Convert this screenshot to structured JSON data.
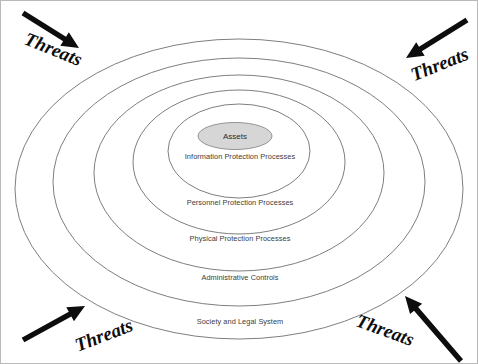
{
  "diagram": {
    "type": "concentric-security-onion",
    "background_color": "#ffffff",
    "border_color": "#b9b9b9",
    "ring_stroke_color": "#6f6f6f",
    "label_color": "#3b3b3b",
    "arrow_color": "#0d0d0d",
    "core": {
      "label": "Assets",
      "fill_color": "#d6d6d6",
      "stroke_color": "#8a8a8a",
      "cx": 234,
      "cy": 135,
      "rx": 37,
      "ry": 13.5
    },
    "rings": [
      {
        "index": 1,
        "label": "Information Protection Processes",
        "cx": 238,
        "cy": 150,
        "rx": 71,
        "ry": 47,
        "label_x": 239,
        "label_y": 158
      },
      {
        "index": 2,
        "label": "Personnel Protection Processes",
        "cx": 238,
        "cy": 161,
        "rx": 106,
        "ry": 72,
        "label_x": 239,
        "label_y": 204
      },
      {
        "index": 3,
        "label": "Physical Protection Processes",
        "cx": 238,
        "cy": 172,
        "rx": 145,
        "ry": 98,
        "label_x": 239,
        "label_y": 240
      },
      {
        "index": 4,
        "label": "Administrative Controls",
        "cx": 238,
        "cy": 181,
        "rx": 186,
        "ry": 124,
        "label_x": 239,
        "label_y": 279
      },
      {
        "index": 5,
        "label": "Society and Legal System",
        "cx": 238,
        "cy": 188,
        "rx": 224,
        "ry": 150,
        "label_x": 239,
        "label_y": 323
      }
    ],
    "threats": [
      {
        "position": "top-left",
        "label": "Threats",
        "label_x": 50,
        "label_y": 54,
        "label_rotation": 22,
        "arrow_tail_x": 22,
        "arrow_tail_y": 12,
        "arrow_tip_x": 78,
        "arrow_tip_y": 47
      },
      {
        "position": "top-right",
        "label": "Threats",
        "label_x": 441,
        "label_y": 69,
        "label_rotation": -22,
        "arrow_tail_x": 466,
        "arrow_tail_y": 19,
        "arrow_tip_x": 405,
        "arrow_tip_y": 57
      },
      {
        "position": "bottom-left",
        "label": "Threats",
        "label_x": 105,
        "label_y": 340,
        "label_rotation": -21,
        "arrow_tail_x": 22,
        "arrow_tail_y": 339,
        "arrow_tip_x": 84,
        "arrow_tip_y": 305
      },
      {
        "position": "bottom-right",
        "label": "Threats",
        "label_x": 382,
        "label_y": 335,
        "label_rotation": 20,
        "arrow_tail_x": 460,
        "arrow_tail_y": 360,
        "arrow_tip_x": 404,
        "arrow_tip_y": 295
      }
    ]
  }
}
